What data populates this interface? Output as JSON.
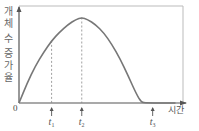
{
  "chart_data": {
    "type": "line",
    "title": "",
    "ylabel": "개체 수 증가율",
    "xlabel": "시간",
    "origin_label": "0",
    "x_range": [
      0,
      10
    ],
    "y_range": [
      0,
      1
    ],
    "series": [
      {
        "name": "개체 수 증가율",
        "color": "#777777",
        "points": [
          [
            0,
            0
          ],
          [
            0.5,
            0.22
          ],
          [
            1,
            0.41
          ],
          [
            1.5,
            0.56
          ],
          [
            2,
            0.69
          ],
          [
            2.5,
            0.79
          ],
          [
            3,
            0.87
          ],
          [
            3.5,
            0.93
          ],
          [
            3.85,
            0.95
          ],
          [
            4.2,
            0.93
          ],
          [
            4.7,
            0.87
          ],
          [
            5.2,
            0.78
          ],
          [
            5.7,
            0.65
          ],
          [
            6.2,
            0.49
          ],
          [
            6.7,
            0.3
          ],
          [
            7.2,
            0.1
          ],
          [
            7.5,
            0.01
          ],
          [
            7.8,
            0
          ],
          [
            9.6,
            0
          ]
        ]
      }
    ],
    "markers": [
      {
        "label": "t",
        "sub": "1",
        "x": 2.0
      },
      {
        "label": "t",
        "sub": "2",
        "x": 3.85
      },
      {
        "label": "t",
        "sub": "3",
        "x": 8.2
      }
    ],
    "dashed_guides": [
      2.0,
      3.85
    ],
    "grid": false
  }
}
